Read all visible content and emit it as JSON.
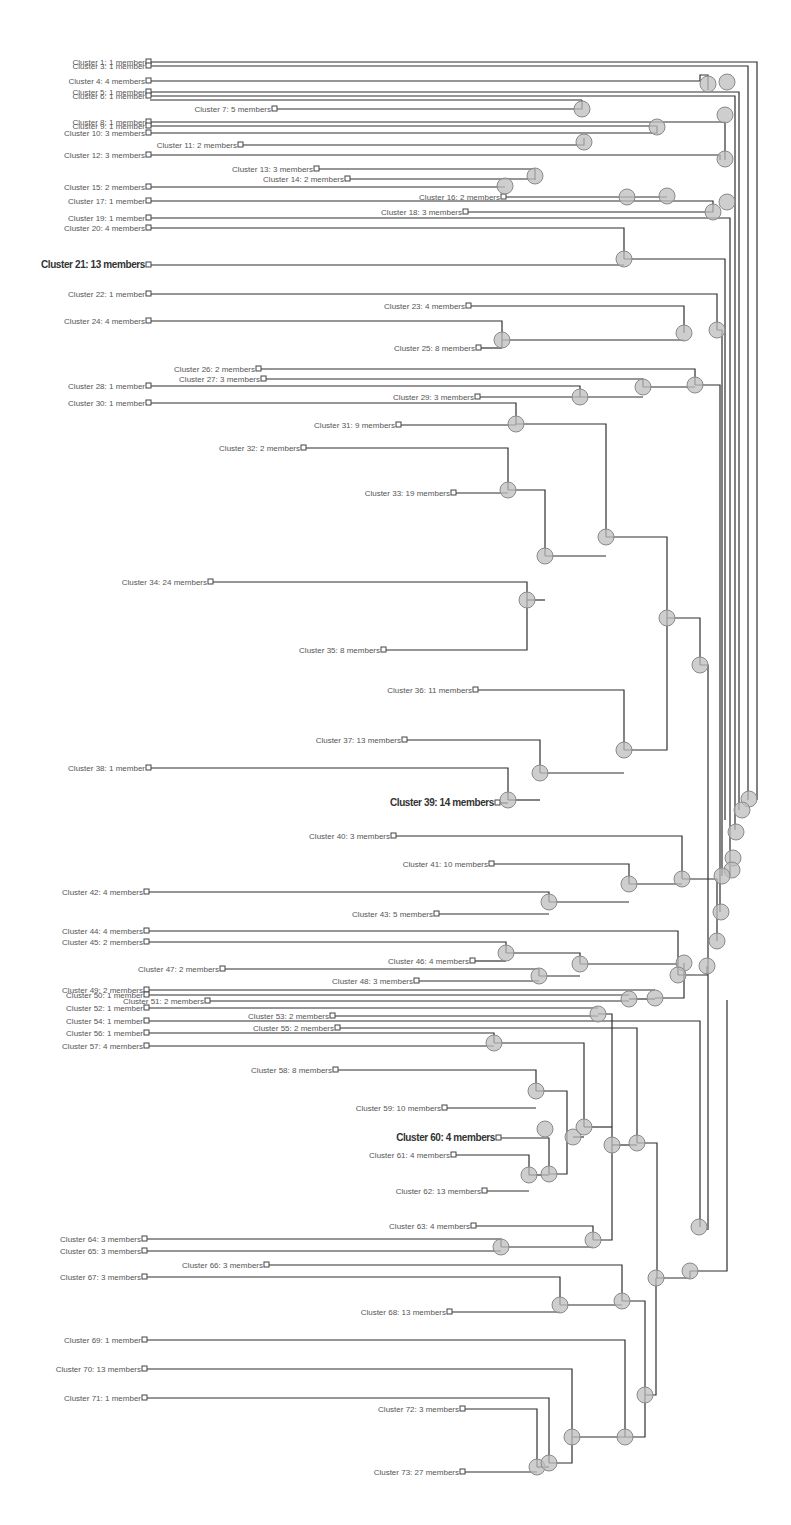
{
  "colors": {
    "edge": "#2f2f2f",
    "node_fill": "#bdbdbd",
    "label": "#555555",
    "background": "#ffffff"
  },
  "leaves": [
    {
      "id": 1,
      "label": "Cluster 1: 1 member",
      "x": 147,
      "y": 62
    },
    {
      "id": 3,
      "label": "Cluster 3: 1 member",
      "x": 147,
      "y": 66
    },
    {
      "id": 4,
      "label": "Cluster 4: 4 members",
      "x": 147,
      "y": 81
    },
    {
      "id": 5,
      "label": "Cluster 5: 1 member",
      "x": 147,
      "y": 92
    },
    {
      "id": 6,
      "label": "Cluster 6: 1 member",
      "x": 147,
      "y": 96
    },
    {
      "id": 7,
      "label": "Cluster 7: 5 members",
      "x": 273,
      "y": 109
    },
    {
      "id": 8,
      "label": "Cluster 8: 1 member",
      "x": 147,
      "y": 122
    },
    {
      "id": 9,
      "label": "Cluster 9: 1 member",
      "x": 147,
      "y": 126
    },
    {
      "id": 10,
      "label": "Cluster 10: 3 members",
      "x": 147,
      "y": 133
    },
    {
      "id": 11,
      "label": "Cluster 11: 2 members",
      "x": 239,
      "y": 145
    },
    {
      "id": 12,
      "label": "Cluster 12: 3 members",
      "x": 147,
      "y": 155
    },
    {
      "id": 13,
      "label": "Cluster 13: 3 members",
      "x": 315,
      "y": 169
    },
    {
      "id": 14,
      "label": "Cluster 14: 2 members",
      "x": 346,
      "y": 179
    },
    {
      "id": 15,
      "label": "Cluster 15: 2 members",
      "x": 147,
      "y": 187
    },
    {
      "id": 16,
      "label": "Cluster 16: 2 members",
      "x": 502,
      "y": 197
    },
    {
      "id": 17,
      "label": "Cluster 17: 1 member",
      "x": 147,
      "y": 201
    },
    {
      "id": 18,
      "label": "Cluster 18: 3 members",
      "x": 464,
      "y": 212
    },
    {
      "id": 19,
      "label": "Cluster 19: 1 member",
      "x": 147,
      "y": 218
    },
    {
      "id": 20,
      "label": "Cluster 20: 4 members",
      "x": 147,
      "y": 228
    },
    {
      "id": 21,
      "label": "Cluster 21: 13 members",
      "x": 147,
      "y": 265,
      "bold": true
    },
    {
      "id": 22,
      "label": "Cluster 22: 1 member",
      "x": 147,
      "y": 294
    },
    {
      "id": 23,
      "label": "Cluster 23: 4 members",
      "x": 467,
      "y": 306
    },
    {
      "id": 24,
      "label": "Cluster 24: 4 members",
      "x": 147,
      "y": 321
    },
    {
      "id": 25,
      "label": "Cluster 25: 8 members",
      "x": 477,
      "y": 348
    },
    {
      "id": 26,
      "label": "Cluster 26: 2 members",
      "x": 257,
      "y": 369
    },
    {
      "id": 27,
      "label": "Cluster 27: 3 members",
      "x": 262,
      "y": 379
    },
    {
      "id": 28,
      "label": "Cluster 28: 1 member",
      "x": 147,
      "y": 386
    },
    {
      "id": 29,
      "label": "Cluster 29: 3 members",
      "x": 476,
      "y": 397
    },
    {
      "id": 30,
      "label": "Cluster 30: 1 member",
      "x": 147,
      "y": 403
    },
    {
      "id": 31,
      "label": "Cluster 31: 9 members",
      "x": 397,
      "y": 425
    },
    {
      "id": 32,
      "label": "Cluster 32: 2 members",
      "x": 302,
      "y": 448
    },
    {
      "id": 33,
      "label": "Cluster 33: 19 members",
      "x": 452,
      "y": 493
    },
    {
      "id": 34,
      "label": "Cluster 34: 24 members",
      "x": 209,
      "y": 582
    },
    {
      "id": 35,
      "label": "Cluster 35: 8 members",
      "x": 382,
      "y": 650
    },
    {
      "id": 36,
      "label": "Cluster 36: 11 members",
      "x": 474,
      "y": 690
    },
    {
      "id": 37,
      "label": "Cluster 37: 13 members",
      "x": 403,
      "y": 740
    },
    {
      "id": 38,
      "label": "Cluster 38: 1 member",
      "x": 147,
      "y": 768
    },
    {
      "id": 39,
      "label": "Cluster 39: 14 members",
      "x": 496,
      "y": 803,
      "bold": true
    },
    {
      "id": 40,
      "label": "Cluster 40: 3 members",
      "x": 392,
      "y": 836
    },
    {
      "id": 41,
      "label": "Cluster 41: 10 members",
      "x": 490,
      "y": 864
    },
    {
      "id": 42,
      "label": "Cluster 42: 4 members",
      "x": 145,
      "y": 892
    },
    {
      "id": 43,
      "label": "Cluster 43: 5 members",
      "x": 435,
      "y": 914
    },
    {
      "id": 44,
      "label": "Cluster 44: 4 members",
      "x": 145,
      "y": 931
    },
    {
      "id": 45,
      "label": "Cluster 45: 2 members",
      "x": 145,
      "y": 942
    },
    {
      "id": 46,
      "label": "Cluster 46: 4 members",
      "x": 471,
      "y": 961
    },
    {
      "id": 47,
      "label": "Cluster 47: 2 members",
      "x": 221,
      "y": 969
    },
    {
      "id": 48,
      "label": "Cluster 48: 3 members",
      "x": 415,
      "y": 981
    },
    {
      "id": 49,
      "label": "Cluster 49: 2 members",
      "x": 145,
      "y": 990
    },
    {
      "id": 50,
      "label": "Cluster 50: 1 member",
      "x": 145,
      "y": 995
    },
    {
      "id": 51,
      "label": "Cluster 51: 2 members",
      "x": 206,
      "y": 1001
    },
    {
      "id": 52,
      "label": "Cluster 52: 1 member",
      "x": 145,
      "y": 1008
    },
    {
      "id": 53,
      "label": "Cluster 53: 2 members",
      "x": 331,
      "y": 1016
    },
    {
      "id": 54,
      "label": "Cluster 54: 1 member",
      "x": 145,
      "y": 1021
    },
    {
      "id": 55,
      "label": "Cluster 55: 2 members",
      "x": 336,
      "y": 1028
    },
    {
      "id": 56,
      "label": "Cluster 56: 1 member",
      "x": 145,
      "y": 1033
    },
    {
      "id": 57,
      "label": "Cluster 57: 4 members",
      "x": 145,
      "y": 1046
    },
    {
      "id": 58,
      "label": "Cluster 58: 8 members",
      "x": 334,
      "y": 1070
    },
    {
      "id": 59,
      "label": "Cluster 59: 10 members",
      "x": 443,
      "y": 1108
    },
    {
      "id": 60,
      "label": "Cluster 60: 4 members",
      "x": 497,
      "y": 1138,
      "bold": true
    },
    {
      "id": 61,
      "label": "Cluster 61: 4 members",
      "x": 452,
      "y": 1155
    },
    {
      "id": 62,
      "label": "Cluster 62: 13 members",
      "x": 483,
      "y": 1191
    },
    {
      "id": 63,
      "label": "Cluster 63: 4 members",
      "x": 472,
      "y": 1226
    },
    {
      "id": 64,
      "label": "Cluster 64: 3 members",
      "x": 143,
      "y": 1239
    },
    {
      "id": 65,
      "label": "Cluster 65: 3 members",
      "x": 143,
      "y": 1251
    },
    {
      "id": 66,
      "label": "Cluster 66: 3 members",
      "x": 265,
      "y": 1265
    },
    {
      "id": 67,
      "label": "Cluster 67: 3 members",
      "x": 143,
      "y": 1277
    },
    {
      "id": 68,
      "label": "Cluster 68: 13 members",
      "x": 448,
      "y": 1312
    },
    {
      "id": 69,
      "label": "Cluster 69: 1 member",
      "x": 143,
      "y": 1340
    },
    {
      "id": 70,
      "label": "Cluster 70: 13 members",
      "x": 143,
      "y": 1369
    },
    {
      "id": 71,
      "label": "Cluster 71: 1 member",
      "x": 143,
      "y": 1398
    },
    {
      "id": 72,
      "label": "Cluster 72: 3 members",
      "x": 461,
      "y": 1409
    },
    {
      "id": 73,
      "label": "Cluster 73: 27 members",
      "x": 461,
      "y": 1472
    }
  ],
  "merge_nodes": [
    [
      708,
      84
    ],
    [
      727,
      82
    ],
    [
      582,
      109
    ],
    [
      657,
      127
    ],
    [
      725,
      115
    ],
    [
      584,
      142
    ],
    [
      535,
      176
    ],
    [
      725,
      159
    ],
    [
      505,
      186
    ],
    [
      627,
      197
    ],
    [
      667,
      196
    ],
    [
      713,
      212
    ],
    [
      727,
      202
    ],
    [
      624,
      259
    ],
    [
      502,
      340
    ],
    [
      684,
      333
    ],
    [
      717,
      330
    ],
    [
      580,
      397
    ],
    [
      643,
      387
    ],
    [
      695,
      385
    ],
    [
      516,
      424
    ],
    [
      508,
      490
    ],
    [
      545,
      556
    ],
    [
      606,
      537
    ],
    [
      527,
      600
    ],
    [
      667,
      618
    ],
    [
      700,
      665
    ],
    [
      624,
      750
    ],
    [
      540,
      773
    ],
    [
      508,
      800
    ],
    [
      749,
      799
    ],
    [
      742,
      810
    ],
    [
      736,
      832
    ],
    [
      733,
      858
    ],
    [
      732,
      870
    ],
    [
      722,
      876
    ],
    [
      721,
      912
    ],
    [
      549,
      902
    ],
    [
      629,
      884
    ],
    [
      682,
      879
    ],
    [
      717,
      941
    ],
    [
      506,
      953
    ],
    [
      580,
      964
    ],
    [
      539,
      976
    ],
    [
      684,
      963
    ],
    [
      678,
      975
    ],
    [
      707,
      966
    ],
    [
      629,
      999
    ],
    [
      655,
      998
    ],
    [
      598,
      1014
    ],
    [
      494,
      1043
    ],
    [
      536,
      1091
    ],
    [
      573,
      1137
    ],
    [
      545,
      1129
    ],
    [
      584,
      1127
    ],
    [
      612,
      1145
    ],
    [
      637,
      1143
    ],
    [
      699,
      1227
    ],
    [
      529,
      1175
    ],
    [
      549,
      1174
    ],
    [
      593,
      1240
    ],
    [
      501,
      1247
    ],
    [
      690,
      1271
    ],
    [
      656,
      1278
    ],
    [
      560,
      1305
    ],
    [
      622,
      1301
    ],
    [
      645,
      1395
    ],
    [
      572,
      1437
    ],
    [
      625,
      1437
    ],
    [
      537,
      1467
    ],
    [
      549,
      1463
    ]
  ],
  "chart_data": {
    "type": "dendrogram",
    "orientation": "horizontal, leaves on left, root on right",
    "leaf_count": 73,
    "highlighted_leaves": [
      "Cluster 21: 13 members",
      "Cluster 39: 14 members",
      "Cluster 60: 4 members"
    ],
    "leaves": [
      {
        "cluster": 1,
        "members": 1
      },
      {
        "cluster": 3,
        "members": 1
      },
      {
        "cluster": 4,
        "members": 4
      },
      {
        "cluster": 5,
        "members": 1
      },
      {
        "cluster": 6,
        "members": 1
      },
      {
        "cluster": 7,
        "members": 5
      },
      {
        "cluster": 8,
        "members": 1
      },
      {
        "cluster": 9,
        "members": 1
      },
      {
        "cluster": 10,
        "members": 3
      },
      {
        "cluster": 11,
        "members": 2
      },
      {
        "cluster": 12,
        "members": 3
      },
      {
        "cluster": 13,
        "members": 3
      },
      {
        "cluster": 14,
        "members": 2
      },
      {
        "cluster": 15,
        "members": 2
      },
      {
        "cluster": 16,
        "members": 2
      },
      {
        "cluster": 17,
        "members": 1
      },
      {
        "cluster": 18,
        "members": 3
      },
      {
        "cluster": 19,
        "members": 1
      },
      {
        "cluster": 20,
        "members": 4
      },
      {
        "cluster": 21,
        "members": 13
      },
      {
        "cluster": 22,
        "members": 1
      },
      {
        "cluster": 23,
        "members": 4
      },
      {
        "cluster": 24,
        "members": 4
      },
      {
        "cluster": 25,
        "members": 8
      },
      {
        "cluster": 26,
        "members": 2
      },
      {
        "cluster": 27,
        "members": 3
      },
      {
        "cluster": 28,
        "members": 1
      },
      {
        "cluster": 29,
        "members": 3
      },
      {
        "cluster": 30,
        "members": 1
      },
      {
        "cluster": 31,
        "members": 9
      },
      {
        "cluster": 32,
        "members": 2
      },
      {
        "cluster": 33,
        "members": 19
      },
      {
        "cluster": 34,
        "members": 24
      },
      {
        "cluster": 35,
        "members": 8
      },
      {
        "cluster": 36,
        "members": 11
      },
      {
        "cluster": 37,
        "members": 13
      },
      {
        "cluster": 38,
        "members": 1
      },
      {
        "cluster": 39,
        "members": 14
      },
      {
        "cluster": 40,
        "members": 3
      },
      {
        "cluster": 41,
        "members": 10
      },
      {
        "cluster": 42,
        "members": 4
      },
      {
        "cluster": 43,
        "members": 5
      },
      {
        "cluster": 44,
        "members": 4
      },
      {
        "cluster": 45,
        "members": 2
      },
      {
        "cluster": 46,
        "members": 4
      },
      {
        "cluster": 47,
        "members": 2
      },
      {
        "cluster": 48,
        "members": 3
      },
      {
        "cluster": 49,
        "members": 2
      },
      {
        "cluster": 50,
        "members": 1
      },
      {
        "cluster": 51,
        "members": 2
      },
      {
        "cluster": 52,
        "members": 1
      },
      {
        "cluster": 53,
        "members": 2
      },
      {
        "cluster": 54,
        "members": 1
      },
      {
        "cluster": 55,
        "members": 2
      },
      {
        "cluster": 56,
        "members": 1
      },
      {
        "cluster": 57,
        "members": 4
      },
      {
        "cluster": 58,
        "members": 8
      },
      {
        "cluster": 59,
        "members": 10
      },
      {
        "cluster": 60,
        "members": 4
      },
      {
        "cluster": 61,
        "members": 4
      },
      {
        "cluster": 62,
        "members": 13
      },
      {
        "cluster": 63,
        "members": 4
      },
      {
        "cluster": 64,
        "members": 3
      },
      {
        "cluster": 65,
        "members": 3
      },
      {
        "cluster": 66,
        "members": 3
      },
      {
        "cluster": 67,
        "members": 3
      },
      {
        "cluster": 68,
        "members": 13
      },
      {
        "cluster": 69,
        "members": 1
      },
      {
        "cluster": 70,
        "members": 13
      },
      {
        "cluster": 71,
        "members": 1
      },
      {
        "cluster": 72,
        "members": 3
      },
      {
        "cluster": 73,
        "members": 27
      }
    ]
  }
}
